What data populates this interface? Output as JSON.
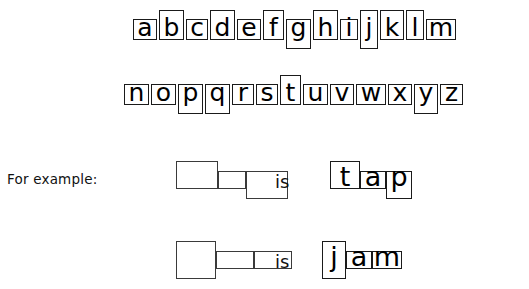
{
  "page": {
    "background_color": "#ffffff",
    "ink_color": "#000000",
    "box_border_color": "#1a1a1a"
  },
  "alphabet": {
    "row1": [
      {
        "letter": "a",
        "shape": "x-height",
        "width": 24
      },
      {
        "letter": "b",
        "shape": "ascender",
        "width": 25
      },
      {
        "letter": "c",
        "shape": "x-height",
        "width": 22
      },
      {
        "letter": "d",
        "shape": "ascender",
        "width": 25
      },
      {
        "letter": "e",
        "shape": "x-height",
        "width": 24
      },
      {
        "letter": "f",
        "shape": "ascender",
        "width": 21
      },
      {
        "letter": "g",
        "shape": "descender",
        "width": 25
      },
      {
        "letter": "h",
        "shape": "ascender",
        "width": 25
      },
      {
        "letter": "i",
        "shape": "x-height",
        "width": 18
      },
      {
        "letter": "j",
        "shape": "full",
        "width": 18
      },
      {
        "letter": "k",
        "shape": "ascender",
        "width": 24
      },
      {
        "letter": "l",
        "shape": "ascender",
        "width": 18
      },
      {
        "letter": "m",
        "shape": "x-height",
        "width": 30
      }
    ],
    "row2": [
      {
        "letter": "n",
        "shape": "x-height",
        "width": 25
      },
      {
        "letter": "o",
        "shape": "x-height",
        "width": 25
      },
      {
        "letter": "p",
        "shape": "descender",
        "width": 25
      },
      {
        "letter": "q",
        "shape": "descender",
        "width": 25
      },
      {
        "letter": "r",
        "shape": "x-height",
        "width": 22
      },
      {
        "letter": "s",
        "shape": "x-height",
        "width": 22
      },
      {
        "letter": "t",
        "shape": "ascender",
        "width": 21
      },
      {
        "letter": "u",
        "shape": "x-height",
        "width": 25
      },
      {
        "letter": "v",
        "shape": "x-height",
        "width": 24
      },
      {
        "letter": "w",
        "shape": "x-height",
        "width": 30
      },
      {
        "letter": "x",
        "shape": "x-height",
        "width": 24
      },
      {
        "letter": "y",
        "shape": "descender",
        "width": 24
      },
      {
        "letter": "z",
        "shape": "x-height",
        "width": 23
      }
    ]
  },
  "for_example_label": "For example:",
  "examples": [
    {
      "connector": "is",
      "answer": "tap",
      "shapes": [
        {
          "shape": "ascender",
          "width": 42,
          "left": 0
        },
        {
          "shape": "x-height",
          "width": 28,
          "left": 42
        },
        {
          "shape": "descender",
          "width": 42,
          "left": 70
        }
      ],
      "letters": [
        {
          "letter": "t",
          "shape": "ascender",
          "width": 30,
          "left": 0
        },
        {
          "letter": "a",
          "shape": "x-height",
          "width": 26,
          "left": 30
        },
        {
          "letter": "p",
          "shape": "descender",
          "width": 26,
          "left": 56
        }
      ]
    },
    {
      "connector": "is",
      "answer": "jam",
      "shapes": [
        {
          "shape": "full",
          "width": 40,
          "left": 0
        },
        {
          "shape": "x-height",
          "width": 38,
          "left": 40
        },
        {
          "shape": "x-height",
          "width": 38,
          "left": 78
        }
      ],
      "letters": [
        {
          "letter": "j",
          "shape": "full",
          "width": 24,
          "left": 0
        },
        {
          "letter": "a",
          "shape": "x-height",
          "width": 26,
          "left": 24
        },
        {
          "letter": "m",
          "shape": "x-height",
          "width": 30,
          "left": 50
        }
      ]
    }
  ],
  "layout": {
    "example1_shapes_left": 176,
    "example1_is_left": 275,
    "example1_word_left": 330,
    "example2_shapes_left": 176,
    "example2_is_left": 275,
    "example2_word_left": 322
  }
}
